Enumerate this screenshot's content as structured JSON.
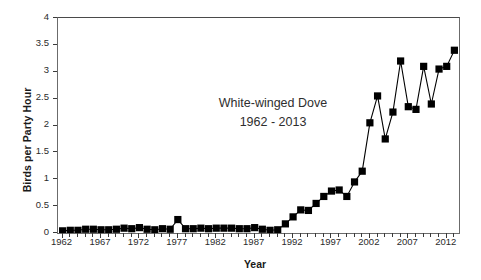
{
  "chart_data": {
    "type": "line",
    "title": "White-winged Dove",
    "subtitle": "1962 - 2013",
    "xlabel": "Year",
    "ylabel": "Birds per Party Hour",
    "xlim": [
      1961.4,
      2013.6
    ],
    "ylim": [
      0,
      4
    ],
    "yticks": [
      0,
      0.5,
      1,
      1.5,
      2,
      2.5,
      3,
      3.5,
      4
    ],
    "ytick_labels": [
      "0",
      "0.5",
      "1",
      "1.5",
      "2",
      "2.5",
      "3",
      "3.5",
      "4"
    ],
    "xticks": [
      1962,
      1967,
      1972,
      1977,
      1982,
      1987,
      1992,
      1997,
      2002,
      2007,
      2012
    ],
    "xtick_labels": [
      "1962",
      "1967",
      "1972",
      "1977",
      "1982",
      "1987",
      "1992",
      "1997",
      "2002",
      "2007",
      "2012"
    ],
    "xtick_minor_step": 1,
    "grid": false,
    "legend": false,
    "marker": "square",
    "marker_color": "#000000",
    "line_color": "#000000",
    "x": [
      1962,
      1963,
      1964,
      1965,
      1966,
      1967,
      1968,
      1969,
      1970,
      1971,
      1972,
      1973,
      1974,
      1975,
      1976,
      1977,
      1978,
      1979,
      1980,
      1981,
      1982,
      1983,
      1984,
      1985,
      1986,
      1987,
      1988,
      1989,
      1990,
      1991,
      1992,
      1993,
      1994,
      1995,
      1996,
      1997,
      1998,
      1999,
      2000,
      2001,
      2002,
      2003,
      2004,
      2005,
      2006,
      2007,
      2008,
      2009,
      2010,
      2011,
      2012,
      2013
    ],
    "values": [
      0.04,
      0.05,
      0.05,
      0.07,
      0.07,
      0.06,
      0.06,
      0.07,
      0.09,
      0.08,
      0.1,
      0.07,
      0.06,
      0.08,
      0.07,
      0.25,
      0.08,
      0.08,
      0.09,
      0.08,
      0.09,
      0.09,
      0.09,
      0.08,
      0.08,
      0.1,
      0.07,
      0.05,
      0.06,
      0.17,
      0.3,
      0.43,
      0.42,
      0.55,
      0.68,
      0.78,
      0.8,
      0.68,
      0.95,
      1.15,
      2.05,
      2.55,
      1.75,
      2.25,
      3.2,
      2.35,
      2.3,
      3.1,
      2.4,
      3.05,
      3.1,
      3.4
    ],
    "series_name": "White-winged Dove"
  }
}
